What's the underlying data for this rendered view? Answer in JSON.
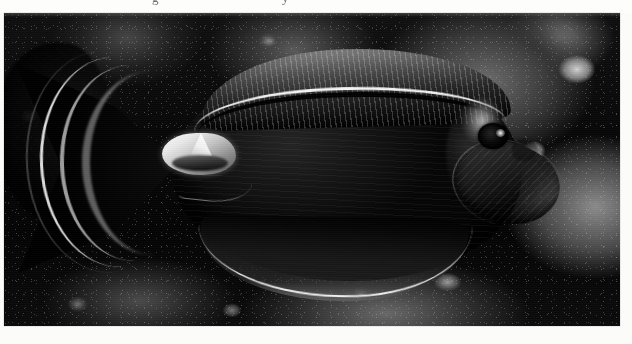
{
  "page": {
    "background_color": "#fbfbfa",
    "medium": "halftone-printed black-and-white photograph on book page",
    "width": 632,
    "height": 344
  },
  "caption_cut_off": {
    "description": "bottom descenders of a line of caption text cropped off at the top edge of the screenshot",
    "visible_fragments": [
      "g",
      "y"
    ],
    "color": "#4a4a48"
  },
  "plate": {
    "label": "reef-fish-photograph",
    "x": 4,
    "y": 13,
    "width": 616,
    "height": 313,
    "border_color": "#d8d8d6",
    "tone": "monochrome",
    "background_color": "#0a0a0a"
  },
  "scene": {
    "subject": "surgeonfish on a coral reef",
    "orientation": "lateral view, facing right",
    "setting": "dark coral reef with mottled rock and rubble"
  },
  "fish": {
    "body": {
      "name": "fish-body",
      "shape": "deep oval / disc-shaped",
      "tone": "very dark, near black",
      "color": "#1a1a19"
    },
    "dorsal_fin": {
      "name": "dorsal-fin",
      "position": "along top of body, sweeping from mid-back to tail",
      "feature": "bright pale stripe along the fin base with fine radiating rays",
      "stripe_color": "#f6f6f0"
    },
    "anal_fin": {
      "name": "anal-fin",
      "position": "along lower body",
      "feature": "thin white margin line on the trailing edge",
      "margin_color": "#f4f4ee"
    },
    "caudal_fin": {
      "name": "caudal-fin",
      "position": "far left of frame",
      "shape": "lunate / crescent with trailing filaments",
      "feature": "bright arcing pale bands"
    },
    "caudal_peduncle": {
      "name": "caudal-peduncle-spine",
      "feature": "bright white triangular spine marking at the base of the tail",
      "color": "#f2f2ec"
    },
    "pectoral_fin": {
      "name": "pectoral-fin",
      "position": "behind and below the eye",
      "tone": "dark paddle with faint ray striping"
    },
    "eye": {
      "name": "fish-eye",
      "tone": "black with a small bright highlight",
      "highlight_color": "#fafaf4"
    },
    "head": {
      "name": "fish-head",
      "feature": "pale highlight on the snout and nape"
    }
  },
  "background": {
    "name": "coral-reef-background",
    "elements": [
      "mottled coral heads",
      "dark crevices",
      "bright rubble and sand patches along the lower edge",
      "a second dark fish silhouette at the far left"
    ],
    "tone_range": [
      "#080808",
      "#d8d8d2"
    ]
  }
}
